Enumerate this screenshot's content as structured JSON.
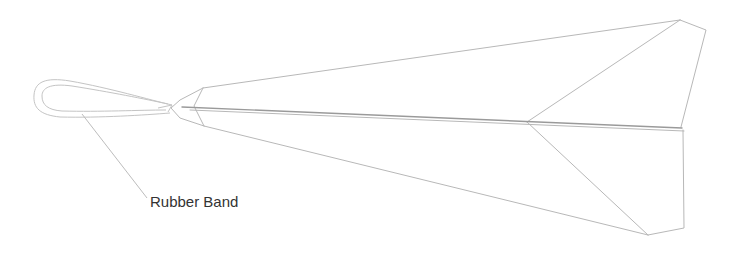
{
  "diagram": {
    "labels": {
      "rubber_band": "Rubber Band"
    },
    "colors": {
      "background": "#ffffff",
      "outline": "#b8b8b8",
      "crease": "#9a9a9a",
      "label_text": "#333333"
    }
  }
}
